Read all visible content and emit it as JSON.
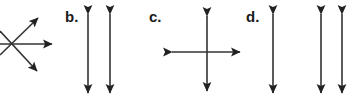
{
  "figure": {
    "width": 361,
    "height": 107,
    "background_color": "#ffffff",
    "stroke_color": "#333333",
    "stroke_width": 1.6,
    "arrowhead_color": "#222222"
  },
  "labels": {
    "b": "b.",
    "c": "c.",
    "d": "d."
  },
  "panels": [
    {
      "key": "a",
      "label": "",
      "label_visible": false,
      "note": "leftmost group is clipped by the left edge of the image",
      "description": "four rays radiating from a common origin point forming an X plus a horizontal ray",
      "origin": {
        "x": 11,
        "y": 44
      },
      "arrows": [
        {
          "name": "horizontal-right-arrow",
          "x1": 0,
          "y1": 44,
          "x2": 52,
          "y2": 44,
          "head_start": false,
          "head_end": true
        },
        {
          "name": "diagonal-up-right-arrow",
          "x1": 0,
          "y1": 55,
          "x2": 38,
          "y2": 18,
          "head_start": false,
          "head_end": true
        },
        {
          "name": "diagonal-down-right-arrow",
          "x1": 0,
          "y1": 31,
          "x2": 37,
          "y2": 71,
          "head_start": false,
          "head_end": true
        }
      ]
    },
    {
      "key": "b",
      "label": "b.",
      "label_visible": true,
      "label_x": 65,
      "label_y": 9,
      "description": "two equal vertical double-headed arrows side by side",
      "arrows": [
        {
          "name": "vertical-double-arrow-1",
          "x1": 88,
          "y1": 14,
          "x2": 88,
          "y2": 93,
          "head_start": true,
          "head_end": true
        },
        {
          "name": "vertical-double-arrow-2",
          "x1": 110,
          "y1": 14,
          "x2": 110,
          "y2": 93,
          "head_start": true,
          "head_end": true
        }
      ]
    },
    {
      "key": "c",
      "label": "c.",
      "label_visible": true,
      "label_x": 149,
      "label_y": 9,
      "description": "a vertical double-headed arrow crossed by a horizontal double-headed arrow",
      "arrows": [
        {
          "name": "horizontal-double-arrow",
          "x1": 172,
          "y1": 52,
          "x2": 240,
          "y2": 52,
          "head_start": true,
          "head_end": true
        },
        {
          "name": "vertical-double-arrow",
          "x1": 207,
          "y1": 16,
          "x2": 207,
          "y2": 91,
          "head_start": true,
          "head_end": true
        }
      ]
    },
    {
      "key": "d",
      "label": "d.",
      "label_visible": true,
      "label_x": 246,
      "label_y": 9,
      "description": "three vertical double-headed arrows, one separated from a pair",
      "arrows": [
        {
          "name": "vertical-double-arrow-1",
          "x1": 273,
          "y1": 14,
          "x2": 273,
          "y2": 93,
          "head_start": true,
          "head_end": true
        },
        {
          "name": "vertical-double-arrow-2",
          "x1": 321,
          "y1": 14,
          "x2": 321,
          "y2": 93,
          "head_start": true,
          "head_end": true
        },
        {
          "name": "vertical-double-arrow-3",
          "x1": 342,
          "y1": 14,
          "x2": 342,
          "y2": 93,
          "head_start": true,
          "head_end": true
        }
      ]
    }
  ]
}
